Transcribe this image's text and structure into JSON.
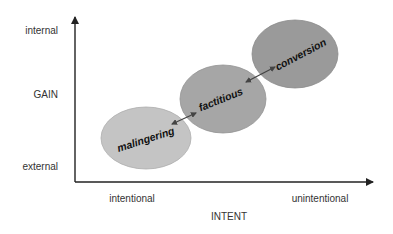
{
  "diagram": {
    "y_axis": {
      "title": "GAIN",
      "top_label": "internal",
      "bottom_label": "external"
    },
    "x_axis": {
      "title": "INTENT",
      "left_label": "intentional",
      "right_label": "unintentional"
    },
    "regions": [
      {
        "label": "malingering",
        "fill": "#c4c4c4"
      },
      {
        "label": "factitious",
        "fill": "#a6a6a6"
      },
      {
        "label": "conversion",
        "fill": "#9a9a9a"
      }
    ],
    "connectors": [
      {
        "from": "malingering",
        "to": "factitious",
        "type": "double-arrow"
      },
      {
        "from": "factitious",
        "to": "conversion",
        "type": "double-arrow"
      }
    ],
    "colors": {
      "axis": "#222222",
      "arrow": "#444444",
      "text": "#333333"
    }
  }
}
